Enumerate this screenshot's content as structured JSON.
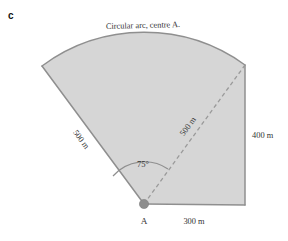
{
  "part_label": "c",
  "figure": {
    "name": "circular-sector-with-triangle",
    "fill_color": "#d6d6d6",
    "stroke_color": "#8f8f8f",
    "dashed_stroke_color": "#9a9a9a",
    "vertex_marker_color": "#8d8d8d",
    "labels": {
      "arc_caption": "Circular arc, centre A.",
      "left_radius": "500 m",
      "dashed_radius": "500 m",
      "right_side": "400 m",
      "bottom_side": "300 m",
      "angle": "75°",
      "vertex": "A"
    },
    "geometry": {
      "centre": {
        "x": 144,
        "y": 204
      },
      "radius_px": 172,
      "left_radius_end": {
        "x": 42,
        "y": 66
      },
      "dashed_radius_end": {
        "x": 245,
        "y": 65
      },
      "bottom_right_corner": {
        "x": 245,
        "y": 205
      },
      "sector_angle_degrees": 75,
      "angle_arc_radius_px": 42
    }
  }
}
